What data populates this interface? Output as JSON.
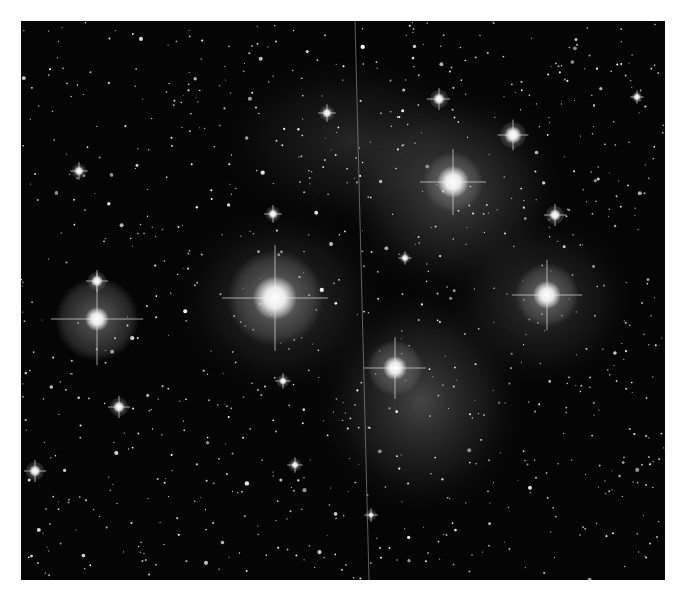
{
  "image": {
    "subject": "star cluster with reflection nebula",
    "mode": "grayscale",
    "border_color": "#ffffff",
    "background_color": "#050505",
    "bright_stars": [
      {
        "x": 254,
        "y": 277,
        "r": 22,
        "halo": 48
      },
      {
        "x": 76,
        "y": 298,
        "r": 12,
        "halo": 42
      },
      {
        "x": 432,
        "y": 161,
        "r": 16,
        "halo": 30
      },
      {
        "x": 526,
        "y": 274,
        "r": 14,
        "halo": 32
      },
      {
        "x": 374,
        "y": 347,
        "r": 12,
        "halo": 28
      },
      {
        "x": 492,
        "y": 114,
        "r": 9,
        "halo": 14
      },
      {
        "x": 418,
        "y": 78,
        "r": 6,
        "halo": 10
      },
      {
        "x": 534,
        "y": 194,
        "r": 6,
        "halo": 10
      },
      {
        "x": 76,
        "y": 260,
        "r": 6,
        "halo": 10
      },
      {
        "x": 98,
        "y": 386,
        "r": 6,
        "halo": 10
      },
      {
        "x": 14,
        "y": 450,
        "r": 6,
        "halo": 10
      },
      {
        "x": 306,
        "y": 92,
        "r": 5,
        "halo": 8
      },
      {
        "x": 252,
        "y": 193,
        "r": 5,
        "halo": 8
      },
      {
        "x": 58,
        "y": 150,
        "r": 5,
        "halo": 8
      },
      {
        "x": 274,
        "y": 444,
        "r": 4,
        "halo": 7
      },
      {
        "x": 262,
        "y": 360,
        "r": 4,
        "halo": 7
      },
      {
        "x": 616,
        "y": 76,
        "r": 4,
        "halo": 6
      },
      {
        "x": 384,
        "y": 237,
        "r": 4,
        "halo": 6
      },
      {
        "x": 350,
        "y": 494,
        "r": 3,
        "halo": 6
      }
    ],
    "nebulae": [
      {
        "cx": 430,
        "cy": 170,
        "rx": 120,
        "ry": 110,
        "opacity": 0.35
      },
      {
        "cx": 400,
        "cy": 380,
        "rx": 110,
        "ry": 120,
        "opacity": 0.35
      },
      {
        "cx": 520,
        "cy": 280,
        "rx": 100,
        "ry": 90,
        "opacity": 0.25
      },
      {
        "cx": 260,
        "cy": 280,
        "rx": 110,
        "ry": 100,
        "opacity": 0.25
      },
      {
        "cx": 330,
        "cy": 120,
        "rx": 140,
        "ry": 90,
        "opacity": 0.18
      }
    ],
    "satellite_trail": {
      "x1": 334,
      "y1": 0,
      "x2": 348,
      "y2": 559
    }
  }
}
